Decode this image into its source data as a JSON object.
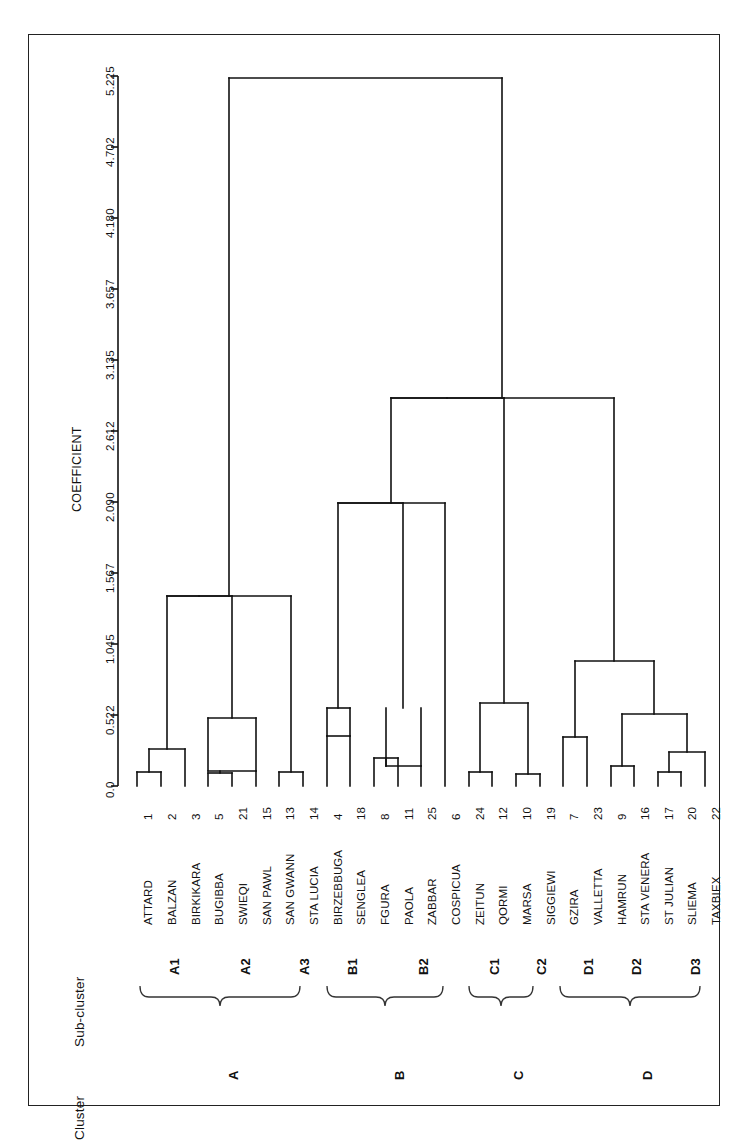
{
  "figure": {
    "axis_title": "COEFFICIENT",
    "cluster_header": "Cluster",
    "subcluster_header": "Sub-cluster"
  },
  "chart_data": {
    "type": "dendrogram",
    "title": "",
    "xlabel": "COEFFICIENT",
    "ylabel": "",
    "orientation": "horizontal-rotated",
    "axis_ticks": [
      "5.225",
      "4.702",
      "4.180",
      "3.657",
      "3.135",
      "2.612",
      "2.090",
      "1.567",
      "1.045",
      "0.522",
      "0.0"
    ],
    "axis_tick_values": [
      5.225,
      4.702,
      4.18,
      3.657,
      3.135,
      2.612,
      2.09,
      1.567,
      1.045,
      0.522,
      0.0
    ],
    "axis_range": [
      0.0,
      5.225
    ],
    "grid": false,
    "legend": "none",
    "leaves": [
      {
        "num": "1",
        "label": "ATTARD",
        "subcluster": "A1",
        "cluster": "A"
      },
      {
        "num": "2",
        "label": "BALZAN",
        "subcluster": "A1",
        "cluster": "A"
      },
      {
        "num": "3",
        "label": "BIRKIKARA",
        "subcluster": "A1",
        "cluster": "A"
      },
      {
        "num": "5",
        "label": "BUGIBBA",
        "subcluster": "A2",
        "cluster": "A"
      },
      {
        "num": "21",
        "label": "SWIEQI",
        "subcluster": "A2",
        "cluster": "A"
      },
      {
        "num": "15",
        "label": "SAN PAWL",
        "subcluster": "A2",
        "cluster": "A"
      },
      {
        "num": "13",
        "label": "SAN GWANN",
        "subcluster": "A3",
        "cluster": "A"
      },
      {
        "num": "14",
        "label": "STA LUCIA",
        "subcluster": "A3",
        "cluster": "A"
      },
      {
        "num": "4",
        "label": "BIRZEBBUGA",
        "subcluster": "B1",
        "cluster": "B"
      },
      {
        "num": "18",
        "label": "SENGLEA",
        "subcluster": "B1",
        "cluster": "B"
      },
      {
        "num": "8",
        "label": "FGURA",
        "subcluster": "B2",
        "cluster": "B"
      },
      {
        "num": "11",
        "label": "PAOLA",
        "subcluster": "B2",
        "cluster": "B"
      },
      {
        "num": "25",
        "label": "ZABBAR",
        "subcluster": "B2",
        "cluster": "B"
      },
      {
        "num": "6",
        "label": "COSPICUA",
        "subcluster": "B2",
        "cluster": "B"
      },
      {
        "num": "24",
        "label": "ZEITUN",
        "subcluster": "C1",
        "cluster": "C"
      },
      {
        "num": "12",
        "label": "QORMI",
        "subcluster": "C1",
        "cluster": "C"
      },
      {
        "num": "10",
        "label": "MARSA",
        "subcluster": "C2",
        "cluster": "C"
      },
      {
        "num": "19",
        "label": "SIGGIEWI",
        "subcluster": "C2",
        "cluster": "C"
      },
      {
        "num": "7",
        "label": "GZIRA",
        "subcluster": "D1",
        "cluster": "D"
      },
      {
        "num": "23",
        "label": "VALLETTA",
        "subcluster": "D1",
        "cluster": "D"
      },
      {
        "num": "9",
        "label": "HAMRUN",
        "subcluster": "D2",
        "cluster": "D"
      },
      {
        "num": "16",
        "label": "STA VENERA",
        "subcluster": "D2",
        "cluster": "D"
      },
      {
        "num": "17",
        "label": "ST JULIAN",
        "subcluster": "D3",
        "cluster": "D"
      },
      {
        "num": "20",
        "label": "SLIEMA",
        "subcluster": "D3",
        "cluster": "D"
      },
      {
        "num": "22",
        "label": "TAXBIEX",
        "subcluster": "D3",
        "cluster": "D"
      }
    ],
    "subclusters": [
      "A1",
      "A2",
      "A3",
      "B1",
      "B2",
      "C1",
      "C2",
      "D1",
      "D2",
      "D3"
    ],
    "clusters": [
      "A",
      "B",
      "C",
      "D"
    ],
    "merges": [
      {
        "left": "1",
        "right": "2",
        "height": 0.1
      },
      {
        "left": "12",
        "right": "3",
        "height": 0.27
      },
      {
        "left": "5",
        "right": "21",
        "height": 0.09
      },
      {
        "left": "521",
        "right": "15",
        "height": 0.1
      },
      {
        "left": "A2",
        "right": "A2b",
        "height": 0.5
      },
      {
        "left": "13",
        "right": "14",
        "height": 0.1
      },
      {
        "left": "A1",
        "right": "A2",
        "height": 1.4
      },
      {
        "left": "A",
        "right": "A3",
        "height": 1.4
      },
      {
        "left": "4",
        "right": "18",
        "height": 0.37
      },
      {
        "left": "B1",
        "right": "B1b",
        "height": 0.57
      },
      {
        "left": "8",
        "right": "11",
        "height": 0.21
      },
      {
        "left": "811",
        "right": "25",
        "height": 0.15
      },
      {
        "left": "B2",
        "right": "B2b",
        "height": 0.57
      },
      {
        "left": "B1",
        "right": "B2",
        "height": 2.19
      },
      {
        "left": "6",
        "right": "B",
        "height": 2.19
      },
      {
        "left": "24",
        "right": "12",
        "height": 0.1
      },
      {
        "left": "C1",
        "right": "C1b",
        "height": 0.62
      },
      {
        "left": "10",
        "right": "19",
        "height": 0.09
      },
      {
        "left": "C2",
        "right": "C1",
        "height": 0.62
      },
      {
        "left": "7",
        "right": "23",
        "height": 0.36
      },
      {
        "left": "D1",
        "right": "D2",
        "height": 0.92
      },
      {
        "left": "9",
        "right": "16",
        "height": 0.15
      },
      {
        "left": "17",
        "right": "20",
        "height": 0.1
      },
      {
        "left": "D3",
        "right": "D3b",
        "height": 0.25
      },
      {
        "left": "D2",
        "right": "D3",
        "height": 0.92
      },
      {
        "left": "B",
        "right": "C",
        "height": 3.0
      },
      {
        "left": "BC",
        "right": "D",
        "height": 3.0
      },
      {
        "left": "A",
        "right": "BCD",
        "height": 5.15
      }
    ]
  }
}
